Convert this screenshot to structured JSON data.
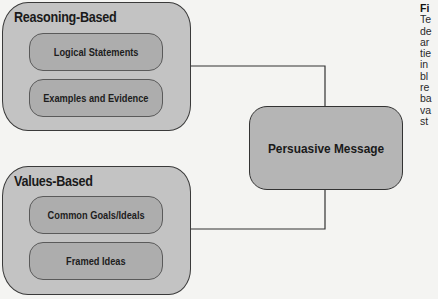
{
  "diagram": {
    "groups": [
      {
        "title": "Reasoning-Based",
        "items": [
          "Logical Statements",
          "Examples and Evidence"
        ]
      },
      {
        "title": "Values-Based",
        "items": [
          "Common Goals/Ideals",
          "Framed Ideas"
        ]
      }
    ],
    "center": {
      "label": "Persuasive Message"
    },
    "connections": [
      {
        "from": "Reasoning-Based",
        "to": "Persuasive Message"
      },
      {
        "from": "Values-Based",
        "to": "Persuasive Message"
      }
    ]
  },
  "side_caption": {
    "heading_fragment": "Fi",
    "line_fragments": [
      "Te",
      "de",
      "ar",
      "tie",
      "in",
      "bl",
      "re",
      "ba",
      "va",
      "st"
    ]
  },
  "colors": {
    "outer_fill": "#c3c3c3",
    "inner_fill": "#adadad",
    "center_fill": "#b5b5b5",
    "stroke": "#333333",
    "background": "#f4f4f2"
  }
}
